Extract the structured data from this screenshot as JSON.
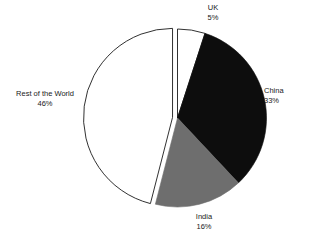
{
  "chart_data": {
    "type": "pie",
    "title": "",
    "subtitle": "",
    "xlabel": "",
    "ylabel": "",
    "legend_position": "none",
    "grid": false,
    "start_angle_deg": 0,
    "direction": "clockwise",
    "categories": [
      "UK",
      "China",
      "India",
      "Rest of the World"
    ],
    "values": [
      5,
      33,
      16,
      46
    ],
    "value_suffix": "%",
    "total": 100,
    "slices": [
      {
        "label": "UK",
        "value": 5,
        "value_label": "5%",
        "color": "#ffffff",
        "stroke": "#1a1a1a",
        "exploded": false
      },
      {
        "label": "China",
        "value": 33,
        "value_label": "33%",
        "color": "#0d0d0d",
        "stroke": "#0d0d0d",
        "exploded": false
      },
      {
        "label": "India",
        "value": 16,
        "value_label": "16%",
        "color": "#6e6e6e",
        "stroke": "#6e6e6e",
        "exploded": false
      },
      {
        "label": "Rest of the World",
        "value": 46,
        "value_label": "46%",
        "color": "#ffffff",
        "stroke": "#1a1a1a",
        "exploded": true
      }
    ]
  },
  "labels": {
    "uk": {
      "name": "UK",
      "value": "5%"
    },
    "china": {
      "name": "China",
      "value": "33%"
    },
    "india": {
      "name": "India",
      "value": "16%"
    },
    "rest_of_world": {
      "name": "Rest of the World",
      "value": "46%"
    }
  },
  "colors": {
    "background": "#ffffff",
    "text": "#1a1a1a",
    "black_slice": "#0d0d0d",
    "gray_slice": "#6e6e6e",
    "white_slice": "#ffffff",
    "outline": "#1a1a1a"
  }
}
